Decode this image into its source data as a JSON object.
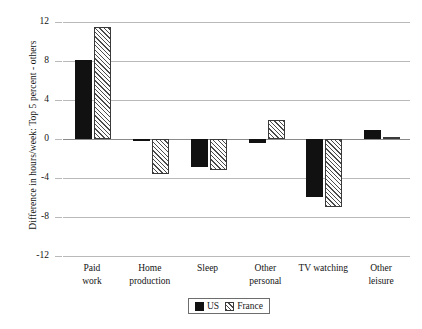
{
  "chart_data": {
    "type": "bar",
    "title": "",
    "xlabel": "",
    "ylabel": "Difference in hours/week: Top 5 percent - others",
    "ylim": [
      -12,
      12
    ],
    "yticks": [
      12,
      8,
      4,
      0,
      -4,
      -8,
      -12
    ],
    "ytick_labels": [
      "12",
      "8",
      "4",
      "0",
      "-4",
      "-8",
      "-12"
    ],
    "grid": true,
    "legend_position": "bottom-center",
    "categories": [
      "Paid work",
      "Home production",
      "Sleep",
      "Other personal",
      "TV watching",
      "Other leisure"
    ],
    "category_lines": [
      [
        "Paid",
        "work"
      ],
      [
        "Home",
        "production"
      ],
      [
        "Sleep",
        ""
      ],
      [
        "Other",
        "personal"
      ],
      [
        "TV watching",
        ""
      ],
      [
        "Other",
        "leisure"
      ]
    ],
    "series": [
      {
        "name": "US",
        "color": "#111111",
        "fill": "solid",
        "values": [
          8.1,
          -0.2,
          -2.9,
          -0.4,
          -5.9,
          0.9
        ]
      },
      {
        "name": "France",
        "color": "#4a4a4a",
        "fill": "hatched-diagonal",
        "values": [
          11.5,
          -3.6,
          -3.2,
          2.0,
          -7.0,
          0.2
        ]
      }
    ]
  },
  "legend": {
    "items": [
      {
        "label": "US"
      },
      {
        "label": "France"
      }
    ]
  }
}
